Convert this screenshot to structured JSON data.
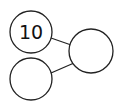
{
  "diagram": {
    "type": "number-bond",
    "whole": {
      "value": "10",
      "position": "top-left"
    },
    "right_part": {
      "value": "",
      "position": "right"
    },
    "bottom_part": {
      "value": "",
      "position": "bottom-left"
    },
    "colors": {
      "stroke": "#222222",
      "fill": "#ffffff",
      "text": "#111111"
    }
  }
}
